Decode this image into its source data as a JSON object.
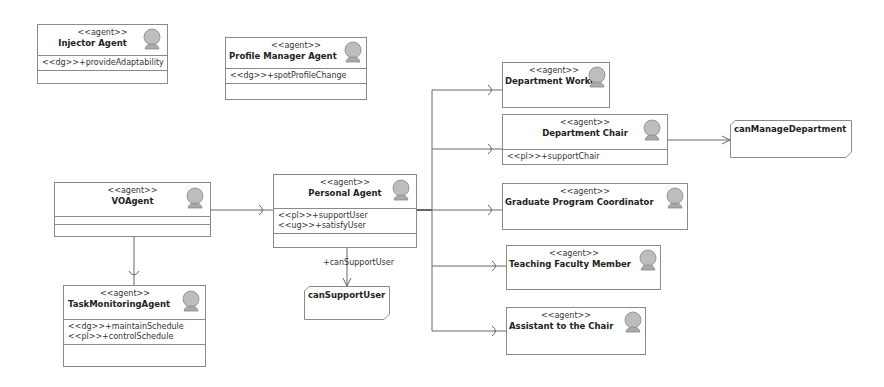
{
  "diagram": {
    "agents": [
      {
        "id": "injector",
        "stereotype": "<<agent>>",
        "name": "Injector Agent",
        "members": [
          "<<dg>>+provideAdaptability"
        ]
      },
      {
        "id": "profile_manager",
        "stereotype": "<<agent>>",
        "name": "Profile Manager Agent",
        "members": [
          "<<dg>>+spotProfileChange"
        ]
      },
      {
        "id": "vo_agent",
        "stereotype": "<<agent>>",
        "name": "VOAgent",
        "members": []
      },
      {
        "id": "personal_agent",
        "stereotype": "<<agent>>",
        "name": "Personal Agent",
        "members": [
          "<<pl>>+supportUser",
          "<<ug>>+satisfyUser"
        ]
      },
      {
        "id": "task_monitoring",
        "stereotype": "<<agent>>",
        "name": "TaskMonitoringAgent",
        "members": [
          "<<dg>>+maintainSchedule",
          "<<pl>>+controlSchedule"
        ]
      },
      {
        "id": "department_worker",
        "stereotype": "<<agent>>",
        "name": "Department Worker",
        "members": []
      },
      {
        "id": "department_chair",
        "stereotype": "<<agent>>",
        "name": "Department Chair",
        "members": [
          "<<pl>>+supportChair"
        ]
      },
      {
        "id": "graduate_coordinator",
        "stereotype": "<<agent>>",
        "name": "Graduate Program Coordinator",
        "members": []
      },
      {
        "id": "teaching_faculty",
        "stereotype": "<<agent>>",
        "name": "Teaching Faculty Member",
        "members": []
      },
      {
        "id": "assistant_chair",
        "stereotype": "<<agent>>",
        "name": "Assistant to the Chair",
        "members": []
      }
    ],
    "goals": [
      {
        "id": "can_manage_department",
        "name": "canManageDepartment"
      },
      {
        "id": "can_support_user",
        "name": "canSupportUser"
      }
    ],
    "edge_labels": {
      "personal_to_can_support_user": "+canSupportUser"
    },
    "icon": "agent-person-icon",
    "colors": {
      "border": "#8a8a8a",
      "line": "#666666",
      "icon_fill": "#bdbdbd"
    }
  }
}
